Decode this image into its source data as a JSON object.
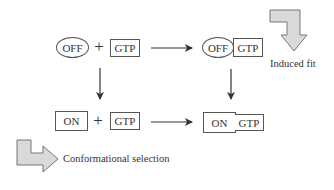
{
  "diagram": {
    "top_left": {
      "protein": "OFF",
      "operator": "+",
      "ligand": "GTP"
    },
    "top_right": {
      "protein": "OFF",
      "ligand": "GTP"
    },
    "bottom_left": {
      "protein": "ON",
      "operator": "+",
      "ligand": "GTP"
    },
    "bottom_right": {
      "protein": "ON",
      "ligand": "GTP"
    },
    "pathways": [
      {
        "name": "Induced fit",
        "label": "Induced fit",
        "direction": "right then down"
      },
      {
        "name": "Conformational selection",
        "label": "Conformational selection",
        "direction": "down then right"
      }
    ]
  },
  "colors": {
    "line": "#333333",
    "box_border": "#555555",
    "pathway_arrow_fill": "#d9d9d9",
    "pathway_arrow_stroke": "#777777"
  }
}
